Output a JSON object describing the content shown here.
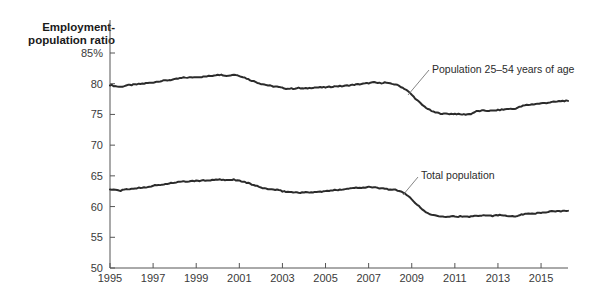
{
  "chart_data": {
    "type": "line",
    "title_line1": "Employment-",
    "title_line2": "population ratio",
    "xlabel": "",
    "ylabel": "Employment-population ratio",
    "ylim": [
      50,
      85
    ],
    "xlim": [
      1995,
      2016.25
    ],
    "grid": false,
    "legend_position": "inline-annotation",
    "ytick_labels": [
      "85%",
      "80",
      "75",
      "70",
      "65",
      "60",
      "55",
      "50"
    ],
    "ytick_values": [
      85,
      80,
      75,
      70,
      65,
      60,
      55,
      50
    ],
    "xtick_labels": [
      "1995",
      "1997",
      "1999",
      "2001",
      "2003",
      "2005",
      "2007",
      "2009",
      "2011",
      "2013",
      "2015"
    ],
    "xtick_values": [
      1995,
      1997,
      1999,
      2001,
      2003,
      2005,
      2007,
      2009,
      2011,
      2013,
      2015
    ],
    "line_color": "#2b2b2b",
    "axis_color": "#555555",
    "annotations": [
      {
        "name": "prime-age-label",
        "text": "Population 25–54 years of age",
        "text_x": 432,
        "text_y": 73,
        "leader": [
          [
            429,
            70
          ],
          [
            408,
            95
          ]
        ]
      },
      {
        "name": "total-population-label",
        "text": "Total population",
        "text_x": 421,
        "text_y": 179,
        "leader": [
          [
            418,
            177
          ],
          [
            403,
            195
          ]
        ]
      }
    ],
    "series": [
      {
        "name": "Population 25-54 years of age",
        "x": [
          1995.0,
          1995.25,
          1995.5,
          1995.75,
          1996.0,
          1996.25,
          1996.5,
          1996.75,
          1997.0,
          1997.25,
          1997.5,
          1997.75,
          1998.0,
          1998.25,
          1998.5,
          1998.75,
          1999.0,
          1999.25,
          1999.5,
          1999.75,
          2000.0,
          2000.25,
          2000.5,
          2000.75,
          2001.0,
          2001.25,
          2001.5,
          2001.75,
          2002.0,
          2002.25,
          2002.5,
          2002.75,
          2003.0,
          2003.25,
          2003.5,
          2003.75,
          2004.0,
          2004.25,
          2004.5,
          2004.75,
          2005.0,
          2005.25,
          2005.5,
          2005.75,
          2006.0,
          2006.25,
          2006.5,
          2006.75,
          2007.0,
          2007.25,
          2007.5,
          2007.75,
          2008.0,
          2008.25,
          2008.5,
          2008.75,
          2009.0,
          2009.25,
          2009.5,
          2009.75,
          2010.0,
          2010.25,
          2010.5,
          2010.75,
          2011.0,
          2011.25,
          2011.5,
          2011.75,
          2012.0,
          2012.25,
          2012.5,
          2012.75,
          2013.0,
          2013.25,
          2013.5,
          2013.75,
          2014.0,
          2014.25,
          2014.5,
          2014.75,
          2015.0,
          2015.25,
          2015.5,
          2015.75,
          2016.0,
          2016.25
        ],
        "values": [
          79.8,
          79.6,
          79.5,
          79.7,
          79.8,
          79.9,
          80.0,
          80.1,
          80.2,
          80.4,
          80.5,
          80.6,
          80.7,
          80.9,
          81.0,
          81.0,
          81.1,
          81.1,
          81.2,
          81.3,
          81.5,
          81.4,
          81.3,
          81.5,
          81.3,
          81.0,
          80.6,
          80.3,
          80.0,
          79.8,
          79.6,
          79.5,
          79.3,
          79.2,
          79.2,
          79.3,
          79.2,
          79.3,
          79.4,
          79.4,
          79.4,
          79.5,
          79.6,
          79.6,
          79.7,
          79.8,
          79.9,
          80.0,
          80.1,
          80.2,
          80.1,
          80.2,
          80.0,
          79.9,
          79.5,
          79.0,
          78.2,
          77.3,
          76.5,
          75.9,
          75.4,
          75.2,
          75.1,
          75.1,
          75.1,
          75.0,
          75.0,
          75.1,
          75.5,
          75.6,
          75.6,
          75.6,
          75.7,
          75.8,
          75.9,
          75.9,
          76.2,
          76.5,
          76.6,
          76.7,
          76.8,
          76.9,
          77.0,
          77.1,
          77.2,
          77.2
        ]
      },
      {
        "name": "Total population",
        "x": [
          1995.0,
          1995.25,
          1995.5,
          1995.75,
          1996.0,
          1996.25,
          1996.5,
          1996.75,
          1997.0,
          1997.25,
          1997.5,
          1997.75,
          1998.0,
          1998.25,
          1998.5,
          1998.75,
          1999.0,
          1999.25,
          1999.5,
          1999.75,
          2000.0,
          2000.25,
          2000.5,
          2000.75,
          2001.0,
          2001.25,
          2001.5,
          2001.75,
          2002.0,
          2002.25,
          2002.5,
          2002.75,
          2003.0,
          2003.25,
          2003.5,
          2003.75,
          2004.0,
          2004.25,
          2004.5,
          2004.75,
          2005.0,
          2005.25,
          2005.5,
          2005.75,
          2006.0,
          2006.25,
          2006.5,
          2006.75,
          2007.0,
          2007.25,
          2007.5,
          2007.75,
          2008.0,
          2008.25,
          2008.5,
          2008.75,
          2009.0,
          2009.25,
          2009.5,
          2009.75,
          2010.0,
          2010.25,
          2010.5,
          2010.75,
          2011.0,
          2011.25,
          2011.5,
          2011.75,
          2012.0,
          2012.25,
          2012.5,
          2012.75,
          2013.0,
          2013.25,
          2013.5,
          2013.75,
          2014.0,
          2014.25,
          2014.5,
          2014.75,
          2015.0,
          2015.25,
          2015.5,
          2015.75,
          2016.0,
          2016.25
        ],
        "values": [
          62.8,
          62.7,
          62.6,
          62.8,
          62.9,
          63.0,
          63.1,
          63.2,
          63.4,
          63.5,
          63.6,
          63.8,
          63.9,
          64.0,
          64.1,
          64.1,
          64.2,
          64.2,
          64.3,
          64.3,
          64.4,
          64.3,
          64.3,
          64.4,
          64.2,
          64.0,
          63.7,
          63.4,
          63.1,
          62.9,
          62.8,
          62.7,
          62.5,
          62.4,
          62.3,
          62.3,
          62.3,
          62.3,
          62.4,
          62.4,
          62.5,
          62.6,
          62.7,
          62.8,
          62.9,
          63.0,
          63.1,
          63.1,
          63.2,
          63.1,
          63.0,
          62.9,
          62.8,
          62.7,
          62.4,
          62.0,
          61.2,
          60.3,
          59.5,
          58.9,
          58.6,
          58.5,
          58.4,
          58.4,
          58.4,
          58.4,
          58.3,
          58.4,
          58.5,
          58.6,
          58.6,
          58.5,
          58.6,
          58.6,
          58.5,
          58.4,
          58.6,
          58.8,
          58.9,
          58.9,
          59.0,
          59.1,
          59.2,
          59.2,
          59.3,
          59.3
        ]
      }
    ]
  }
}
